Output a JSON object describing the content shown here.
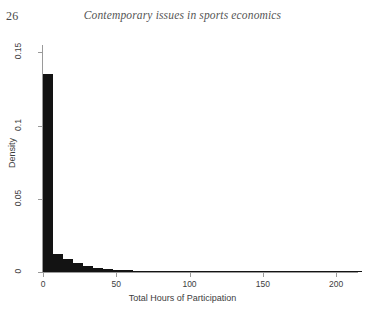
{
  "page": {
    "folio": "26",
    "running_title": "Contemporary issues in sports economics"
  },
  "chart_data": {
    "type": "bar",
    "title": "",
    "xlabel": "Total Hours of Participation",
    "ylabel": "Density",
    "xlim": [
      0,
      215
    ],
    "ylim": [
      0,
      0.155
    ],
    "grid": false,
    "legend": null,
    "bin_width": 6.8,
    "x_ticks": [
      0,
      50,
      100,
      150,
      200
    ],
    "x_tick_labels": [
      "0",
      "50",
      "100",
      "150",
      "200"
    ],
    "y_ticks": [
      0,
      0.05,
      0.1,
      0.15
    ],
    "y_tick_labels": [
      "0",
      "0.05",
      "0.1",
      "0.15"
    ],
    "categories": [
      "0-6.8",
      "6.8-13.6",
      "13.6-20.4",
      "20.4-27.2",
      "27.2-34",
      "34-40.8",
      "40.8-47.6",
      "47.6-54.4",
      "54.4-61.2",
      "61.2-68",
      "68-74.8",
      "74.8-81.6",
      "81.6-88.4",
      "88.4-95.2",
      "95.2-102",
      "102-108.8",
      "108.8-115.6",
      "115.6-122.4",
      "122.4-129.2",
      "129.2-136",
      "136-142.8",
      "142.8-149.6",
      "149.6-156.4",
      "156.4-163.2",
      "163.2-170",
      "170-176.8",
      "176.8-183.6",
      "183.6-190.4",
      "190.4-197.2",
      "197.2-204",
      "204-210.8",
      "210.8-217.6"
    ],
    "x": [
      3.4,
      10.2,
      17,
      23.8,
      30.6,
      37.4,
      44.2,
      51,
      57.8,
      64.6,
      71.4,
      78.2,
      85,
      91.8,
      98.6,
      105.4,
      112.2,
      119,
      125.8,
      132.6,
      139.4,
      146.2,
      153,
      159.8,
      166.6,
      173.4,
      180.2,
      187,
      193.8,
      200.6,
      207.4,
      214.2
    ],
    "values": [
      0.135,
      0.0125,
      0.0088,
      0.006,
      0.0042,
      0.003,
      0.0022,
      0.0016,
      0.0012,
      0.0009,
      0.0006,
      0.0005,
      0.0004,
      0.0004,
      0.0003,
      0.0003,
      0.0002,
      0.0002,
      0.0002,
      0.0002,
      0.0001,
      0.0001,
      0.0001,
      0.0001,
      0.0001,
      0.0001,
      0.0001,
      0.0001,
      0.0001,
      0.0001,
      0.0001,
      0.0001
    ],
    "bar_color": "#131313",
    "axis_color": "#9a9a9a"
  }
}
